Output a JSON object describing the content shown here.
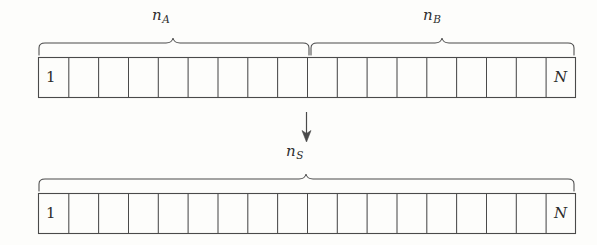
{
  "figure": {
    "kind": "diagram",
    "background_color": "#fdfdfb",
    "ink_color": "#3a3a3a",
    "braces_top": [
      {
        "name": "brace-a",
        "label_base": "n",
        "label_sub": "A",
        "x_start": 38,
        "x_end": 310,
        "label_x": 157,
        "label_y": 8
      },
      {
        "name": "brace-b",
        "label_base": "n",
        "label_sub": "B",
        "x_start": 310,
        "x_end": 575,
        "label_x": 428,
        "label_y": 8
      }
    ],
    "braces_bottom": [
      {
        "name": "brace-s",
        "label_base": "n",
        "label_sub": "S",
        "x_start": 38,
        "x_end": 575,
        "label_x": 290,
        "label_y": 140
      }
    ],
    "bars": [
      {
        "name": "upper-bar",
        "x": 38,
        "y": 57,
        "width": 537,
        "height": 40,
        "start_label": "1",
        "end_label": "N",
        "divisions": 18,
        "tick_count": 17,
        "split_at_division": 9
      },
      {
        "name": "lower-bar",
        "x": 38,
        "y": 193,
        "width": 537,
        "height": 40,
        "start_label": "1",
        "end_label": "N",
        "divisions": 18,
        "tick_count": 17
      }
    ],
    "arrow": {
      "name": "down-arrow",
      "glyph": "↓",
      "x": 306,
      "y_start": 110,
      "y_end": 140
    }
  }
}
